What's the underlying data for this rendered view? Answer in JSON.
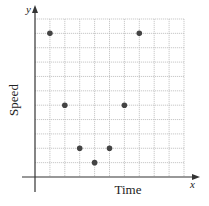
{
  "chart_data": {
    "type": "scatter",
    "title": "",
    "xlabel": "Time",
    "ylabel": "Speed",
    "x_axis_letter": "x",
    "y_axis_letter": "y",
    "grid": true,
    "grid_cols": 10,
    "grid_rows": 11,
    "xlim": [
      0,
      10
    ],
    "ylim": [
      0,
      11
    ],
    "points": [
      {
        "x": 1,
        "y": 10
      },
      {
        "x": 2,
        "y": 5
      },
      {
        "x": 3,
        "y": 2
      },
      {
        "x": 4,
        "y": 1
      },
      {
        "x": 5,
        "y": 2
      },
      {
        "x": 6,
        "y": 5
      },
      {
        "x": 7,
        "y": 10
      }
    ],
    "point_color": "#444444",
    "grid_color": "#bbbbbb",
    "axis_color": "#333333"
  }
}
